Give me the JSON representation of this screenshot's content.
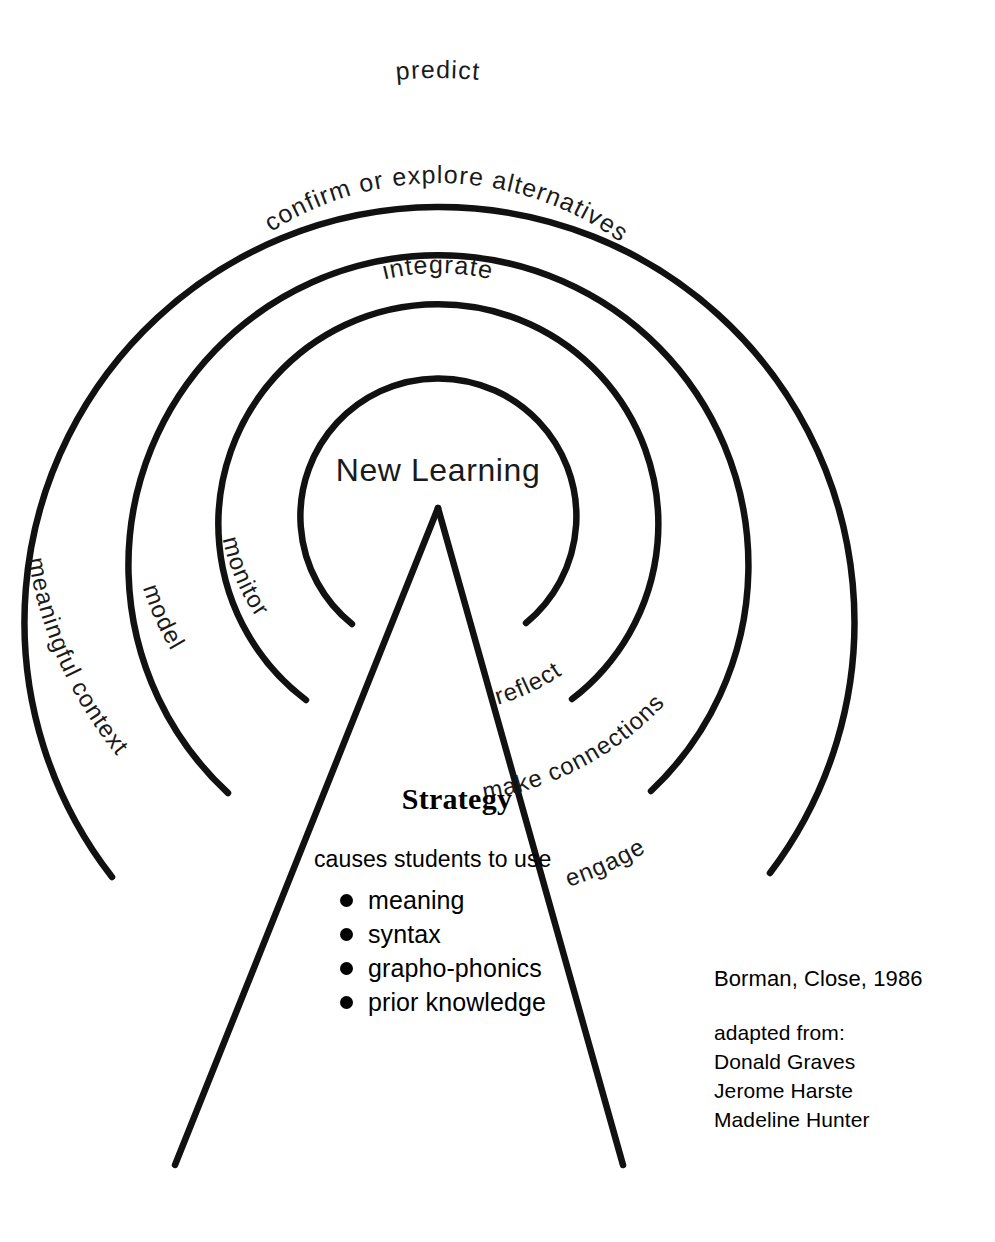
{
  "diagram": {
    "center_label": "New Learning",
    "geometry": {
      "center_x": 438,
      "center_y": 493,
      "radii": [
        415,
        310,
        220,
        138
      ],
      "apex_x": 438,
      "apex_y": 508,
      "leg_left_x": 175,
      "leg_right_x": 623,
      "leg_bottom_y": 1165
    },
    "colors": {
      "stroke": "#111111",
      "text": "#1a1a1a",
      "background": "#ffffff"
    },
    "rings": [
      {
        "index": 1,
        "name": "outer-ring",
        "radius": 415,
        "top_label": "predict",
        "left_label": "meaningful context",
        "right_label": "engage"
      },
      {
        "index": 2,
        "name": "second-ring",
        "radius": 310,
        "top_label": "confirm or explore alternatives",
        "left_label": "model",
        "right_label": "make connections"
      },
      {
        "index": 3,
        "name": "third-ring",
        "radius": 220,
        "top_label": "integrate",
        "left_label": "monitor",
        "right_label": "reflect"
      },
      {
        "index": 4,
        "name": "inner-ring",
        "radius": 138,
        "top_label": "",
        "left_label": "",
        "right_label": ""
      }
    ],
    "arc_labels": {
      "predict": "predict",
      "confirm_or_explore_alternatives": "confirm or explore alternatives",
      "integrate": "integrate",
      "monitor": "monitor",
      "model": "model",
      "meaningful_context": "meaningful context",
      "reflect": "reflect",
      "make_connections": "make connections",
      "engage": "engage"
    }
  },
  "strategy": {
    "title": "Strategy",
    "subtitle": "causes students to use",
    "items": [
      "meaning",
      "syntax",
      "grapho-phonics",
      "prior knowledge"
    ]
  },
  "credit": {
    "primary": "Borman, Close, 1986",
    "adapted_label": "adapted from:",
    "sources": [
      "Donald Graves",
      "Jerome Harste",
      "Madeline Hunter"
    ]
  }
}
